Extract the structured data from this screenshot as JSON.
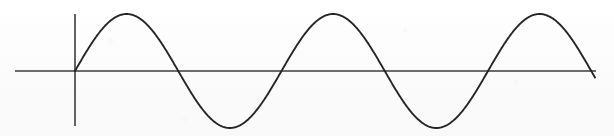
{
  "figure": {
    "title": "",
    "background_color": "#fcfcfc",
    "width": 614,
    "height": 136
  },
  "chart_data": {
    "type": "line",
    "title": "",
    "subtitle": "",
    "xlabel": "",
    "ylabel": "",
    "grid": false,
    "legend": null,
    "legend_position": "none",
    "annotations": [],
    "xticks": [],
    "yticks": [],
    "xtick_labels": [],
    "ytick_labels": [],
    "axes": {
      "x_axis_visible": true,
      "y_axis_visible": true,
      "x_axis_color": "#3c3c3c",
      "y_axis_color": "#3c3c3c",
      "x_axis_pixel_y": 71,
      "x_axis_pixel_x_start": 15,
      "x_axis_pixel_x_end": 596,
      "y_axis_pixel_x": 75,
      "y_axis_pixel_y_start": 14,
      "y_axis_pixel_y_end": 126,
      "line_width": 1.6
    },
    "series": [
      {
        "name": "sine",
        "color": "#262626",
        "line_width": 1.9,
        "function": "y = A*sin(2*pi*(x - x0)/T)",
        "amplitude_px": 57,
        "period_px": 206.5,
        "origin_px": 75,
        "start_px": 75,
        "end_px": 595,
        "cycles": 2.52,
        "x": [
          75,
          101,
          130,
          152,
          178,
          204,
          230,
          256,
          282,
          308,
          337,
          359,
          385,
          411,
          440,
          466,
          492,
          518,
          543,
          569,
          595
        ],
        "y": [
          0,
          40,
          57,
          40,
          0,
          -40,
          -57,
          -40,
          0,
          40,
          57,
          40,
          0,
          -40,
          -57,
          -40,
          0,
          40,
          57,
          40,
          0
        ],
        "key_points": {
          "peaks_x": [
            130,
            337,
            543
          ],
          "peaks_y": [
            57,
            57,
            57
          ],
          "troughs_x": [
            230,
            440
          ],
          "troughs_y": [
            -57,
            -57
          ],
          "zero_crossings_x": [
            75,
            178,
            282,
            385,
            492,
            595
          ]
        },
        "ylim": [
          -62,
          62
        ],
        "xlim": [
          15,
          596
        ]
      }
    ]
  }
}
